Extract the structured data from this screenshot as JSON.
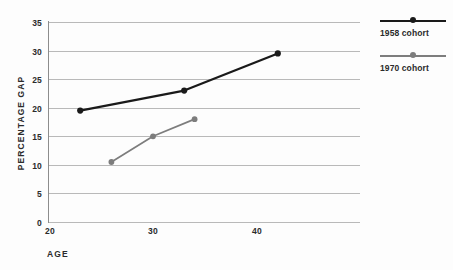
{
  "chart_data": {
    "type": "line",
    "title": "",
    "xlabel": "AGE",
    "ylabel": "PERCENTAGE GAP",
    "xlim": [
      20,
      50
    ],
    "ylim": [
      0,
      35
    ],
    "xticks": [
      20,
      30,
      40
    ],
    "yticks": [
      0,
      5,
      10,
      15,
      20,
      25,
      30,
      35
    ],
    "grid": true,
    "legend_position": "right",
    "series": [
      {
        "name": "1958 cohort",
        "color": "#1a1a1a",
        "marker": "circle",
        "x": [
          23,
          33,
          42
        ],
        "y": [
          19.5,
          23,
          29.5
        ]
      },
      {
        "name": "1970 cohort",
        "color": "#7d7d7d",
        "marker": "circle",
        "x": [
          26,
          30,
          34
        ],
        "y": [
          10.5,
          15,
          18
        ]
      }
    ]
  },
  "axes": {
    "y_title": "PERCENTAGE GAP",
    "x_title": "AGE",
    "y_tick_labels": [
      "35",
      "30",
      "25",
      "20",
      "15",
      "10",
      "5",
      "0"
    ],
    "x_tick_labels": [
      "20",
      "30",
      "40"
    ]
  },
  "legend": {
    "entries": [
      {
        "label": "1958 cohort",
        "color": "#1a1a1a"
      },
      {
        "label": "1970 cohort",
        "color": "#7d7d7d"
      }
    ]
  },
  "colors": {
    "grid": "#b9b9b9",
    "axis": "#8d8d8d",
    "text": "#2b2b2b",
    "background": "#fdfdfd",
    "series_1958": "#1a1a1a",
    "series_1970": "#7d7d7d"
  }
}
